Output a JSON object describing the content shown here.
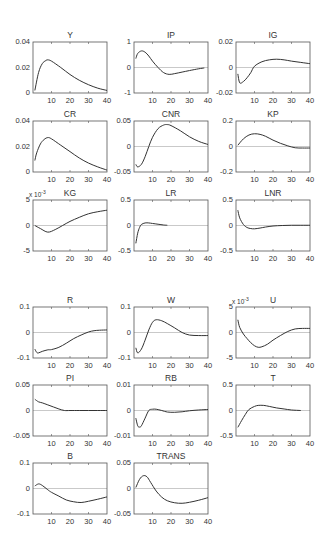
{
  "figure": {
    "layout": {
      "rows": 6,
      "cols": 3
    },
    "colors": {
      "line": "#333333",
      "zero_line": "#bbbbbb",
      "axes": "#555555"
    }
  },
  "chart_data": [
    {
      "type": "line",
      "title": "Y",
      "xlim": [
        0,
        40
      ],
      "ylim": [
        0,
        0.04
      ],
      "yticks": [
        "0.04",
        "0.02",
        "0"
      ],
      "xticks": [
        "10",
        "20",
        "30",
        "40"
      ],
      "exponent": "",
      "x": [
        1,
        3,
        5,
        7,
        8,
        10,
        15,
        20,
        25,
        30,
        35,
        40
      ],
      "values": [
        0.002,
        0.016,
        0.023,
        0.0255,
        0.026,
        0.025,
        0.02,
        0.0145,
        0.01,
        0.0065,
        0.0038,
        0.002
      ]
    },
    {
      "type": "line",
      "title": "IP",
      "xlim": [
        0,
        40
      ],
      "ylim": [
        -1,
        1
      ],
      "yticks": [
        "1",
        "0",
        "-1"
      ],
      "xticks": [
        "10",
        "20",
        "30",
        "40"
      ],
      "exponent": "",
      "x": [
        1,
        2,
        4,
        6,
        8,
        10,
        13,
        16,
        19,
        22,
        26,
        30,
        35,
        38
      ],
      "values": [
        0.35,
        0.55,
        0.65,
        0.6,
        0.45,
        0.25,
        0.0,
        -0.2,
        -0.27,
        -0.24,
        -0.18,
        -0.12,
        -0.05,
        -0.02
      ]
    },
    {
      "type": "line",
      "title": "IG",
      "xlim": [
        0,
        40
      ],
      "ylim": [
        -0.02,
        0.02
      ],
      "yticks": [
        "0.02",
        "0",
        "-0.02"
      ],
      "xticks": [
        "10",
        "20",
        "30",
        "40"
      ],
      "exponent": "",
      "x": [
        1,
        2,
        4,
        6,
        8,
        10,
        14,
        18,
        22,
        26,
        30,
        35,
        40
      ],
      "values": [
        -0.005,
        -0.012,
        -0.011,
        -0.008,
        -0.004,
        0.001,
        0.0045,
        0.006,
        0.0065,
        0.006,
        0.005,
        0.004,
        0.003
      ]
    },
    {
      "type": "line",
      "title": "CR",
      "xlim": [
        0,
        40
      ],
      "ylim": [
        0,
        0.04
      ],
      "yticks": [
        "0.04",
        "0.02",
        "0"
      ],
      "xticks": [
        "10",
        "20",
        "30",
        "40"
      ],
      "exponent": "",
      "x": [
        1,
        2,
        4,
        6,
        8,
        10,
        15,
        20,
        25,
        30,
        35,
        40
      ],
      "values": [
        0.009,
        0.015,
        0.022,
        0.0255,
        0.027,
        0.026,
        0.021,
        0.016,
        0.011,
        0.007,
        0.004,
        0.0015
      ]
    },
    {
      "type": "line",
      "title": "CNR",
      "xlim": [
        0,
        40
      ],
      "ylim": [
        -0.05,
        0.05
      ],
      "yticks": [
        "0.05",
        "0",
        "-0.05"
      ],
      "xticks": [
        "10",
        "20",
        "30",
        "40"
      ],
      "exponent": "",
      "x": [
        1,
        2,
        4,
        6,
        8,
        10,
        13,
        16,
        18,
        20,
        25,
        30,
        35,
        40
      ],
      "values": [
        -0.035,
        -0.04,
        -0.035,
        -0.02,
        0.0,
        0.018,
        0.035,
        0.042,
        0.043,
        0.041,
        0.031,
        0.019,
        0.01,
        0.004
      ]
    },
    {
      "type": "line",
      "title": "KP",
      "xlim": [
        0,
        40
      ],
      "ylim": [
        -0.2,
        0.2
      ],
      "yticks": [
        "0.2",
        "0",
        "-0.2"
      ],
      "xticks": [
        "10",
        "20",
        "30",
        "40"
      ],
      "exponent": "",
      "x": [
        1,
        4,
        7,
        10,
        13,
        16,
        20,
        24,
        28,
        32,
        36,
        40
      ],
      "values": [
        0.01,
        0.06,
        0.09,
        0.1,
        0.095,
        0.08,
        0.05,
        0.025,
        0.005,
        -0.01,
        -0.012,
        -0.012
      ]
    },
    {
      "type": "line",
      "title": "KG",
      "xlim": [
        0,
        40
      ],
      "ylim": [
        -5,
        5
      ],
      "yticks": [
        "5",
        "0",
        "-5"
      ],
      "xticks": [
        "10",
        "20",
        "30",
        "40"
      ],
      "exponent": "x 10^-3",
      "x": [
        1,
        4,
        8,
        12,
        16,
        20,
        25,
        30,
        35,
        40
      ],
      "values": [
        0.0,
        -0.6,
        -1.3,
        -0.8,
        0.0,
        0.8,
        1.6,
        2.3,
        2.7,
        3.0
      ]
    },
    {
      "type": "line",
      "title": "LR",
      "xlim": [
        0,
        40
      ],
      "ylim": [
        -0.5,
        0.5
      ],
      "yticks": [
        "0.5",
        "0",
        "-0.5"
      ],
      "xticks": [
        "10",
        "20",
        "30",
        "40"
      ],
      "exponent": "",
      "x": [
        1,
        2,
        3,
        4,
        6,
        8,
        10,
        13,
        16,
        18
      ],
      "values": [
        -0.35,
        -0.15,
        -0.04,
        0.02,
        0.05,
        0.05,
        0.04,
        0.025,
        0.01,
        0.005
      ]
    },
    {
      "type": "line",
      "title": "LNR",
      "xlim": [
        0,
        40
      ],
      "ylim": [
        -0.5,
        0.5
      ],
      "yticks": [
        "0.5",
        "0",
        "-0.5"
      ],
      "xticks": [
        "10",
        "20",
        "30",
        "40"
      ],
      "exponent": "",
      "x": [
        1,
        2,
        4,
        6,
        8,
        10,
        13,
        16,
        20,
        25,
        30,
        35,
        40
      ],
      "values": [
        0.3,
        0.15,
        0.02,
        -0.04,
        -0.06,
        -0.065,
        -0.05,
        -0.03,
        -0.01,
        0.0,
        0.005,
        0.005,
        0.005
      ]
    },
    {
      "type": "line",
      "title": "R",
      "xlim": [
        0,
        40
      ],
      "ylim": [
        -0.1,
        0.1
      ],
      "yticks": [
        "0.1",
        "0",
        "-0.1"
      ],
      "xticks": [
        "10",
        "20",
        "30",
        "40"
      ],
      "exponent": "",
      "x": [
        1,
        2,
        3,
        5,
        8,
        10,
        14,
        18,
        22,
        26,
        30,
        33,
        36,
        40
      ],
      "values": [
        -0.065,
        -0.078,
        -0.08,
        -0.074,
        -0.068,
        -0.067,
        -0.058,
        -0.042,
        -0.024,
        -0.01,
        0.002,
        0.007,
        0.009,
        0.01
      ]
    },
    {
      "type": "line",
      "title": "W",
      "xlim": [
        0,
        40
      ],
      "ylim": [
        -0.1,
        0.1
      ],
      "yticks": [
        "0.1",
        "0",
        "-0.1"
      ],
      "xticks": [
        "10",
        "20",
        "30",
        "40"
      ],
      "exponent": "",
      "x": [
        1,
        2,
        4,
        6,
        8,
        10,
        12,
        15,
        18,
        22,
        26,
        30,
        35,
        40
      ],
      "values": [
        -0.06,
        -0.08,
        -0.065,
        -0.03,
        0.01,
        0.04,
        0.05,
        0.046,
        0.035,
        0.018,
        0.0,
        -0.01,
        -0.012,
        -0.012
      ]
    },
    {
      "type": "line",
      "title": "U",
      "xlim": [
        0,
        40
      ],
      "ylim": [
        -5,
        5
      ],
      "yticks": [
        "5",
        "0",
        "-5"
      ],
      "xticks": [
        "10",
        "20",
        "30",
        "40"
      ],
      "exponent": "x 10^-3",
      "x": [
        1,
        2,
        4,
        6,
        8,
        10,
        12,
        14,
        17,
        20,
        24,
        28,
        32,
        36,
        40
      ],
      "values": [
        2.5,
        1.0,
        -0.3,
        -1.2,
        -2.0,
        -2.6,
        -2.9,
        -2.8,
        -2.3,
        -1.5,
        -0.6,
        0.2,
        0.7,
        0.8,
        0.8
      ]
    },
    {
      "type": "line",
      "title": "PI",
      "xlim": [
        0,
        40
      ],
      "ylim": [
        -0.05,
        0.05
      ],
      "yticks": [
        "0.05",
        "0",
        "-0.05"
      ],
      "xticks": [
        "10",
        "20",
        "30",
        "40"
      ],
      "exponent": "",
      "x": [
        1,
        3,
        5,
        8,
        11,
        14,
        17,
        20,
        25,
        30,
        35,
        40
      ],
      "values": [
        0.022,
        0.017,
        0.015,
        0.011,
        0.007,
        0.003,
        0.0,
        0.0,
        0.0,
        0.0,
        0.0,
        0.0
      ]
    },
    {
      "type": "line",
      "title": "RB",
      "xlim": [
        0,
        40
      ],
      "ylim": [
        -0.01,
        0.01
      ],
      "yticks": [
        "0.01",
        "0",
        "-0.01"
      ],
      "xticks": [
        "10",
        "20",
        "30",
        "40"
      ],
      "exponent": "",
      "x": [
        1,
        2,
        3,
        4,
        6,
        8,
        10,
        12,
        15,
        18,
        22,
        26,
        30,
        35,
        40
      ],
      "values": [
        -0.003,
        -0.006,
        -0.0065,
        -0.006,
        -0.003,
        0.0,
        0.0005,
        0.0005,
        0.0,
        -0.0006,
        -0.0007,
        -0.0005,
        -0.0001,
        0.0002,
        0.0004
      ]
    },
    {
      "type": "line",
      "title": "T",
      "xlim": [
        0,
        40
      ],
      "ylim": [
        -0.5,
        0.5
      ],
      "yticks": [
        "0.5",
        "0",
        "-0.5"
      ],
      "xticks": [
        "10",
        "20",
        "30",
        "40"
      ],
      "exponent": "",
      "x": [
        1,
        3,
        5,
        7,
        10,
        12,
        15,
        18,
        22,
        26,
        30,
        35
      ],
      "values": [
        -0.33,
        -0.2,
        -0.08,
        0.02,
        0.08,
        0.1,
        0.1,
        0.08,
        0.05,
        0.03,
        0.01,
        0.0
      ]
    },
    {
      "type": "line",
      "title": "B",
      "xlim": [
        0,
        40
      ],
      "ylim": [
        -0.1,
        0.1
      ],
      "yticks": [
        "0.1",
        "0",
        "-0.1"
      ],
      "xticks": [
        "10",
        "20",
        "30",
        "40"
      ],
      "exponent": "",
      "x": [
        1,
        3,
        5,
        8,
        10,
        14,
        18,
        22,
        26,
        30,
        35,
        40
      ],
      "values": [
        0.01,
        0.018,
        0.012,
        -0.005,
        -0.015,
        -0.03,
        -0.045,
        -0.052,
        -0.055,
        -0.05,
        -0.042,
        -0.033
      ]
    },
    {
      "type": "line",
      "title": "TRANS",
      "xlim": [
        0,
        40
      ],
      "ylim": [
        -0.05,
        0.05
      ],
      "yticks": [
        "0.05",
        "0",
        "-0.05"
      ],
      "xticks": [
        "10",
        "20",
        "30",
        "40"
      ],
      "exponent": "",
      "x": [
        1,
        3,
        5,
        7,
        9,
        12,
        15,
        18,
        22,
        26,
        30,
        35,
        40
      ],
      "values": [
        0.002,
        0.018,
        0.025,
        0.023,
        0.012,
        -0.005,
        -0.017,
        -0.024,
        -0.028,
        -0.029,
        -0.027,
        -0.023,
        -0.018
      ]
    }
  ]
}
